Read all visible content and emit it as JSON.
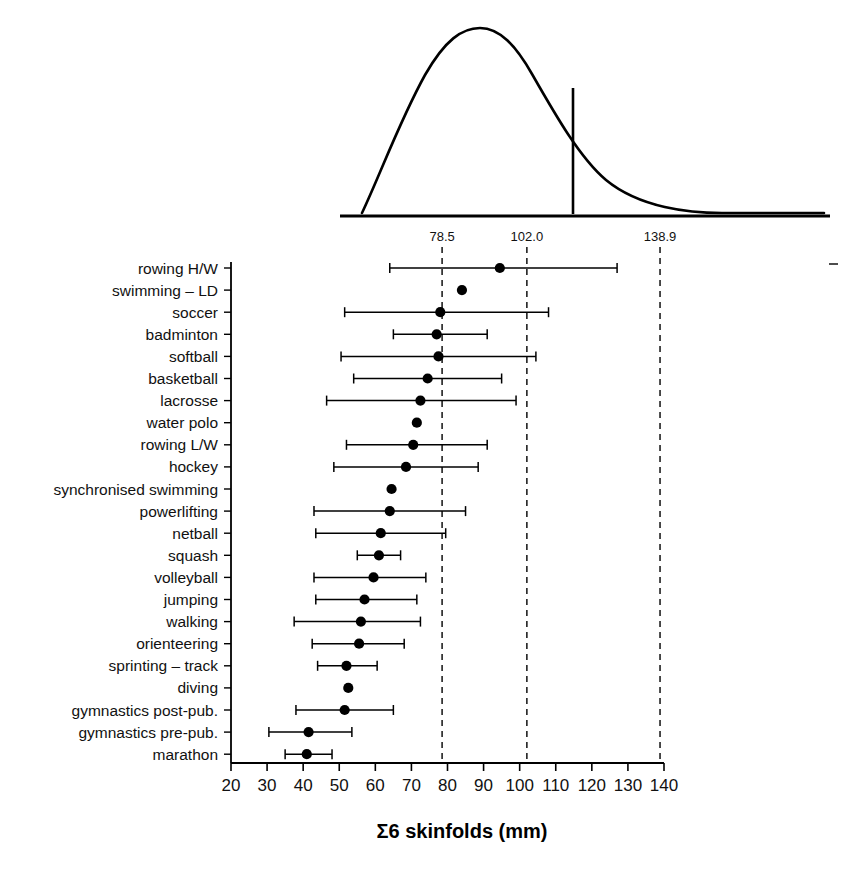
{
  "figure": {
    "title_x_axis": "Σ6 skinfolds (mm)",
    "sigma_glyph": "Σ"
  },
  "chart_data": {
    "type": "scatter",
    "title": "",
    "subtitle": "",
    "xlabel": "Σ6 skinfolds (mm)",
    "ylabel": "",
    "xlim": [
      20,
      140
    ],
    "ylim": [
      0,
      23
    ],
    "grid": false,
    "legend_position": "none",
    "xticks": [
      20,
      30,
      40,
      50,
      60,
      70,
      80,
      90,
      100,
      110,
      120,
      130,
      140
    ],
    "xticklabels": [
      "20",
      "30",
      "40",
      "50",
      "60",
      "70",
      "80",
      "90",
      "100",
      "110",
      "120",
      "130",
      "140"
    ],
    "reference_lines": [
      {
        "value": 78.5,
        "label": "78.5",
        "style": "dashed"
      },
      {
        "value": 102.0,
        "label": "102.0",
        "style": "dashed"
      },
      {
        "value": 138.9,
        "label": "138.9",
        "style": "dashed"
      }
    ],
    "marker": "filled-circle",
    "error_bar_style": "horizontal-range-with-caps",
    "categories": [
      "rowing H/W",
      "swimming – LD",
      "soccer",
      "badminton",
      "softball",
      "basketball",
      "lacrosse",
      "water polo",
      "rowing L/W",
      "hockey",
      "synchronised swimming",
      "powerlifting",
      "netball",
      "squash",
      "volleyball",
      "jumping",
      "walking",
      "orienteering",
      "sprinting – track",
      "diving",
      "gymnastics post-pub.",
      "gymnastics pre-pub.",
      "marathon"
    ],
    "values": [
      94.5,
      84.0,
      78.0,
      77.0,
      77.5,
      74.5,
      72.5,
      71.5,
      70.5,
      68.5,
      64.5,
      64.0,
      61.5,
      61.0,
      59.5,
      57.0,
      56.0,
      55.5,
      52.0,
      52.5,
      51.5,
      41.5,
      41.0
    ],
    "ranges": [
      {
        "low": 30.0,
        "high": 30.0,
        "present": false
      },
      {
        "low": 0,
        "high": 0,
        "present": false
      },
      {
        "low": 0,
        "high": 0,
        "present": false
      },
      {
        "low": 0,
        "high": 0,
        "present": false
      },
      {
        "low": 0,
        "high": 0,
        "present": false
      },
      {
        "low": 0,
        "high": 0,
        "present": false
      },
      {
        "low": 0,
        "high": 0,
        "present": false
      },
      {
        "low": 0,
        "high": 0,
        "present": false
      },
      {
        "low": 0,
        "high": 0,
        "present": false
      },
      {
        "low": 0,
        "high": 0,
        "present": false
      },
      {
        "low": 0,
        "high": 0,
        "present": false
      },
      {
        "low": 0,
        "high": 0,
        "present": false
      },
      {
        "low": 0,
        "high": 0,
        "present": false
      },
      {
        "low": 0,
        "high": 0,
        "present": false
      },
      {
        "low": 0,
        "high": 0,
        "present": false
      },
      {
        "low": 0,
        "high": 0,
        "present": false
      },
      {
        "low": 0,
        "high": 0,
        "present": false
      },
      {
        "low": 0,
        "high": 0,
        "present": false
      },
      {
        "low": 0,
        "high": 0,
        "present": false
      },
      {
        "low": 0,
        "high": 0,
        "present": false
      },
      {
        "low": 0,
        "high": 0,
        "present": false
      },
      {
        "low": 0,
        "high": 0,
        "present": false
      },
      {
        "low": 0,
        "high": 0,
        "present": false
      }
    ],
    "points": [
      {
        "category": "rowing H/W",
        "value": 94.5,
        "low": 64.0,
        "high": 127.0,
        "has_range": true
      },
      {
        "category": "swimming – LD",
        "value": 84.0,
        "low": null,
        "high": null,
        "has_range": false
      },
      {
        "category": "soccer",
        "value": 78.0,
        "low": 51.5,
        "high": 108.0,
        "has_range": true
      },
      {
        "category": "badminton",
        "value": 77.0,
        "low": 65.0,
        "high": 91.0,
        "has_range": true
      },
      {
        "category": "softball",
        "value": 77.5,
        "low": 50.5,
        "high": 104.5,
        "has_range": true
      },
      {
        "category": "basketball",
        "value": 74.5,
        "low": 54.0,
        "high": 95.0,
        "has_range": true
      },
      {
        "category": "lacrosse",
        "value": 72.5,
        "low": 46.5,
        "high": 99.0,
        "has_range": true
      },
      {
        "category": "water polo",
        "value": 71.5,
        "low": null,
        "high": null,
        "has_range": false
      },
      {
        "category": "rowing L/W",
        "value": 70.5,
        "low": 52.0,
        "high": 91.0,
        "has_range": true
      },
      {
        "category": "hockey",
        "value": 68.5,
        "low": 48.5,
        "high": 88.5,
        "has_range": true
      },
      {
        "category": "synchronised swimming",
        "value": 64.5,
        "low": null,
        "high": null,
        "has_range": false
      },
      {
        "category": "powerlifting",
        "value": 64.0,
        "low": 43.0,
        "high": 85.0,
        "has_range": true
      },
      {
        "category": "netball",
        "value": 61.5,
        "low": 43.5,
        "high": 79.5,
        "has_range": true
      },
      {
        "category": "squash",
        "value": 61.0,
        "low": 55.0,
        "high": 67.0,
        "has_range": true
      },
      {
        "category": "volleyball",
        "value": 59.5,
        "low": 43.0,
        "high": 74.0,
        "has_range": true
      },
      {
        "category": "jumping",
        "value": 57.0,
        "low": 43.5,
        "high": 71.5,
        "has_range": true
      },
      {
        "category": "walking",
        "value": 56.0,
        "low": 37.5,
        "high": 72.5,
        "has_range": true
      },
      {
        "category": "orienteering",
        "value": 55.5,
        "low": 42.5,
        "high": 68.0,
        "has_range": true
      },
      {
        "category": "sprinting – track",
        "value": 52.0,
        "low": 44.0,
        "high": 60.5,
        "has_range": true
      },
      {
        "category": "diving",
        "value": 52.5,
        "low": null,
        "high": null,
        "has_range": false
      },
      {
        "category": "gymnastics post-pub.",
        "value": 51.5,
        "low": 38.0,
        "high": 65.0,
        "has_range": true
      },
      {
        "category": "gymnastics pre-pub.",
        "value": 41.5,
        "low": 30.5,
        "high": 53.5,
        "has_range": true
      },
      {
        "category": "marathon",
        "value": 41.0,
        "low": 35.0,
        "high": 48.0,
        "has_range": true
      }
    ],
    "distribution_curve": {
      "description": "right-skewed density curve above the plot",
      "marker_line_value": 102.0,
      "baseline": true
    }
  }
}
